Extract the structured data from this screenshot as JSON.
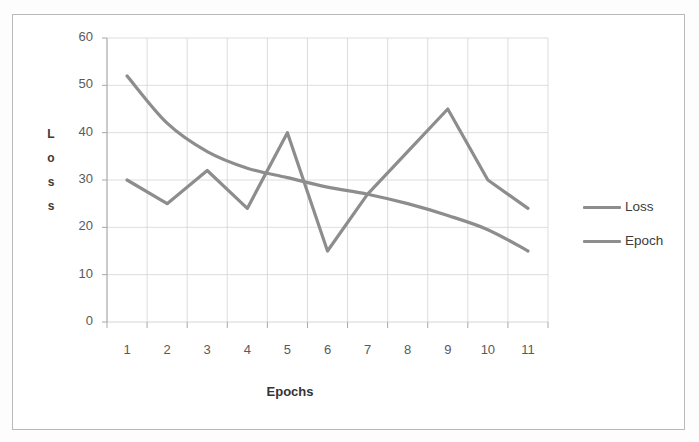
{
  "chart_data": {
    "type": "line",
    "title": "",
    "xlabel": "Epochs",
    "ylabel": "Loss",
    "ylabel_letters": [
      "L",
      "o",
      "s",
      "s"
    ],
    "categories": [
      1,
      2,
      3,
      4,
      5,
      6,
      7,
      8,
      9,
      10,
      11
    ],
    "xtick_labels": [
      "1",
      "2",
      "3",
      "4",
      "5",
      "6",
      "7",
      "8",
      "9",
      "10",
      "11"
    ],
    "ytick_labels": [
      "0",
      "10",
      "20",
      "30",
      "40",
      "50",
      "60"
    ],
    "yticks": [
      0,
      10,
      20,
      30,
      40,
      50,
      60
    ],
    "ylim": [
      0,
      60
    ],
    "grid": true,
    "grid_color": "#d4d4d4",
    "legend_position": "right",
    "series": [
      {
        "name": "Loss",
        "color": "#8d8d8d",
        "smooth": true,
        "values": [
          52,
          42,
          36,
          32.5,
          30.5,
          28.5,
          27,
          25,
          22.5,
          19.5,
          15
        ]
      },
      {
        "name": "Epoch",
        "color": "#8d8d8d",
        "smooth": false,
        "values": [
          30,
          25,
          32,
          24,
          40,
          15,
          27,
          36,
          45,
          30,
          24
        ]
      }
    ]
  },
  "legend": {
    "items": [
      {
        "label": "Loss"
      },
      {
        "label": "Epoch"
      }
    ]
  },
  "colors": {
    "line": "#8d8d8d",
    "grid": "#d4d4d4",
    "axis": "#a8a8a8",
    "text": "#4a4a4a",
    "frame": "#b9b9b9"
  }
}
